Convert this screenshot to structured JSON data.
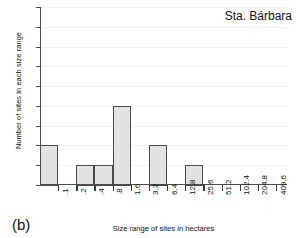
{
  "chart_data": {
    "type": "bar",
    "title": "Sta. Bárbara",
    "xlabel": "Size range of sites in hectares",
    "ylabel": "Number of sites in each size range",
    "panel_letter": "(b)",
    "categories": [
      ".1",
      ".2",
      ".4",
      ".8",
      "1.6",
      "3.2",
      "6.4",
      "12.8",
      "25.6",
      "51.2",
      "102.4",
      "204.8",
      "409.6"
    ],
    "values": [
      2,
      0,
      1,
      1,
      4,
      0,
      2,
      0,
      1,
      0,
      0,
      0,
      0
    ],
    "bin_upper_edges": [
      0.1,
      0.2,
      0.4,
      0.8,
      1.6,
      3.2,
      6.4,
      12.8,
      25.6,
      51.2,
      102.4,
      204.8,
      409.6
    ],
    "ylim": [
      0,
      9
    ],
    "yticks": [
      0,
      1,
      2,
      3,
      4,
      5,
      6,
      7,
      8,
      9
    ],
    "ytick_labels": [
      "",
      "1",
      "2",
      "3",
      "4",
      "5",
      "6",
      "7",
      "8",
      "9"
    ],
    "grid": true,
    "legend": "none",
    "colors": {
      "bar_fill": "#e2e2e2",
      "bar_edge": "#4a4a4a",
      "axis": "#4d4d4d",
      "grid": "#f3f3f3",
      "text": "#111111",
      "background": "#ffffff"
    }
  }
}
